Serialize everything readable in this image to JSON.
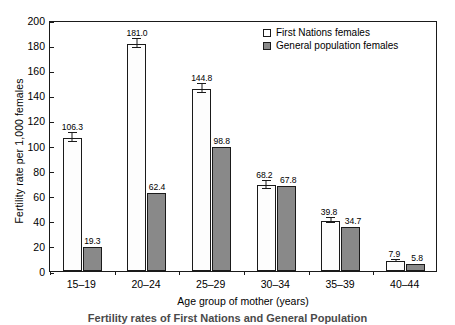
{
  "chart_data": {
    "type": "bar",
    "title": "",
    "xlabel": "Age group of mother (years)",
    "ylabel": "Fertility rate per 1,000 females",
    "categories": [
      "15–19",
      "20–24",
      "25–29",
      "30–34",
      "35–39",
      "40–44"
    ],
    "ylim": [
      0,
      200
    ],
    "yticks": [
      0,
      20,
      40,
      60,
      80,
      100,
      120,
      140,
      160,
      180,
      200
    ],
    "grid": false,
    "legend_position": "top-right",
    "series": [
      {
        "name": "First Nations females",
        "color": "#ffffff",
        "pattern": "dotted",
        "values": [
          106.3,
          181.0,
          144.8,
          68.2,
          39.8,
          7.9
        ],
        "labels": [
          "106.3",
          "181.0",
          "144.8",
          "68.2",
          "39.8",
          "7.9"
        ],
        "errors": [
          4.0,
          4.2,
          4.0,
          3.4,
          2.4,
          1.2
        ]
      },
      {
        "name": "General population females",
        "color": "#898989",
        "pattern": "solid",
        "values": [
          19.3,
          62.4,
          98.8,
          67.8,
          34.7,
          5.8
        ],
        "labels": [
          "19.3",
          "62.4",
          "98.8",
          "67.8",
          "34.7",
          "5.8"
        ],
        "errors": [
          0.4,
          0.5,
          0.6,
          0.5,
          0.4,
          0.2
        ]
      }
    ]
  },
  "legend": {
    "entries": [
      {
        "label": "First Nations females"
      },
      {
        "label": "General population females"
      }
    ]
  },
  "caption": {
    "text": "Fertility rates of First Nations and General Population"
  }
}
